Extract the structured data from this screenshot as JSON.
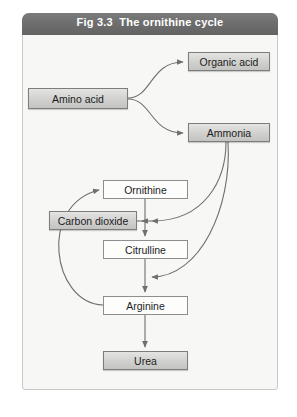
{
  "figure": {
    "title": "Fig 3.3  The ornithine cycle",
    "background_color": "#f7f7f5",
    "title_bar_color": "#6e6e6e",
    "frame_border_color": "#c9c9c6"
  },
  "nodes": [
    {
      "id": "amino-acid",
      "label": "Amino acid",
      "style": "shaded"
    },
    {
      "id": "organic-acid",
      "label": "Organic acid",
      "style": "shaded"
    },
    {
      "id": "ammonia",
      "label": "Ammonia",
      "style": "shaded"
    },
    {
      "id": "ornithine",
      "label": "Ornithine",
      "style": "plain"
    },
    {
      "id": "carbon-dioxide",
      "label": "Carbon dioxide",
      "style": "shaded"
    },
    {
      "id": "citrulline",
      "label": "Citrulline",
      "style": "plain"
    },
    {
      "id": "arginine",
      "label": "Arginine",
      "style": "plain"
    },
    {
      "id": "urea",
      "label": "Urea",
      "style": "shaded"
    }
  ],
  "edges": [
    {
      "from": "amino-acid",
      "to": "organic-acid",
      "kind": "curve",
      "arrow": true
    },
    {
      "from": "amino-acid",
      "to": "ammonia",
      "kind": "curve",
      "arrow": true
    },
    {
      "from": "ammonia",
      "to": "ornithine-step",
      "kind": "curve",
      "arrow": true
    },
    {
      "from": "ammonia",
      "to": "citrulline-step",
      "kind": "curve",
      "arrow": true
    },
    {
      "from": "ornithine",
      "to": "citrulline",
      "kind": "straight",
      "arrow": true
    },
    {
      "from": "ornithine-step",
      "to": "carbon-dioxide",
      "kind": "straight",
      "arrow": true
    },
    {
      "from": "citrulline",
      "to": "arginine",
      "kind": "straight",
      "arrow": true
    },
    {
      "from": "arginine",
      "to": "urea",
      "kind": "straight",
      "arrow": true
    },
    {
      "from": "arginine",
      "to": "ornithine",
      "kind": "curve",
      "arrow": true
    }
  ],
  "line_color": "#6f6f6f"
}
